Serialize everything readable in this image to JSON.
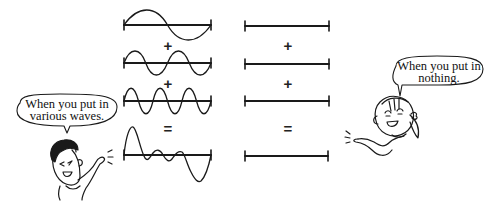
{
  "left_column": {
    "operators": [
      "+",
      "+",
      "="
    ],
    "waves": [
      {
        "name": "wave-1",
        "cycles": 1,
        "amplitude": 10
      },
      {
        "name": "wave-2",
        "cycles": 2,
        "amplitude": 8
      },
      {
        "name": "wave-3",
        "cycles": 3,
        "amplitude": 9
      },
      {
        "name": "sum-wave",
        "kind": "composite"
      }
    ]
  },
  "right_column": {
    "operators": [
      "+",
      "+",
      "="
    ],
    "lines": [
      "flat-1",
      "flat-2",
      "flat-3",
      "flat-sum"
    ]
  },
  "left_character": {
    "speech_line1": "When you put in",
    "speech_line2": "various waves."
  },
  "right_character": {
    "speech_line1": "When you put in",
    "speech_line2": "nothing."
  },
  "colors": {
    "ink": "#1a1a1a",
    "background": "#ffffff"
  }
}
